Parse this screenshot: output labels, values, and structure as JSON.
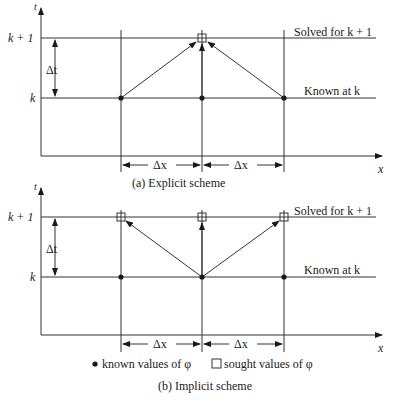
{
  "panel_a": {
    "caption": "(a) Explicit scheme",
    "y_axis_label": "t",
    "x_axis_label": "x",
    "level_upper": "k + 1",
    "level_lower": "k",
    "dt_label": "Δt",
    "dx_labels": [
      "Δx",
      "Δx"
    ],
    "upper_line_label": "Solved for k + 1",
    "lower_line_label": "Known at k"
  },
  "panel_b": {
    "caption": "(b) Implicit scheme",
    "y_axis_label": "t",
    "x_axis_label": "x",
    "level_upper": "k + 1",
    "level_lower": "k",
    "dt_label": "Δt",
    "dx_labels": [
      "Δx",
      "Δx"
    ],
    "upper_line_label": "Solved for k + 1",
    "lower_line_label": "Known at k"
  },
  "legend": {
    "known": "known values of φ",
    "sought": "sought values of φ"
  }
}
